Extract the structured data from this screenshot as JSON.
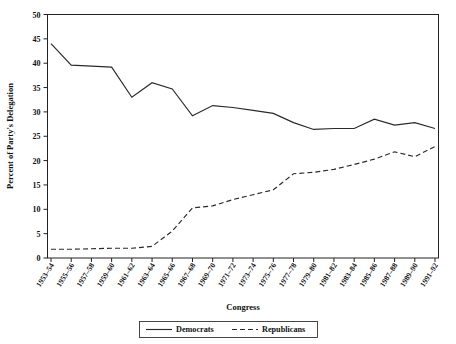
{
  "chart_data": {
    "type": "line",
    "title": "",
    "xlabel": "Congress",
    "ylabel": "Percent of Party's Delegation",
    "ylim": [
      0,
      50
    ],
    "yticks": [
      0,
      5,
      10,
      15,
      20,
      25,
      30,
      35,
      40,
      45,
      50
    ],
    "grid": false,
    "legend_position": "bottom-center",
    "categories": [
      "1953–54",
      "1955–56",
      "1957–58",
      "1959–60",
      "1961–62",
      "1963–64",
      "1965–66",
      "1967–68",
      "1969–70",
      "1971–72",
      "1973–74",
      "1975–76",
      "1977–78",
      "1979–80",
      "1981–82",
      "1983–84",
      "1985–86",
      "1987–88",
      "1989–90",
      "1991–92"
    ],
    "series": [
      {
        "name": "Democrats",
        "style": "solid",
        "color": "#2a2a2a",
        "values": [
          44.0,
          39.6,
          39.4,
          39.2,
          33.0,
          36.0,
          34.7,
          29.2,
          31.3,
          30.9,
          30.3,
          29.7,
          27.8,
          26.4,
          26.6,
          26.6,
          28.5,
          27.3,
          27.8,
          26.6
        ]
      },
      {
        "name": "Republicans",
        "style": "dashed",
        "color": "#2a2a2a",
        "values": [
          1.8,
          1.8,
          1.9,
          2.0,
          2.0,
          2.4,
          5.5,
          10.3,
          10.7,
          12.0,
          13.0,
          14.0,
          17.3,
          17.6,
          18.2,
          19.2,
          20.3,
          21.8,
          20.8,
          22.9
        ]
      }
    ],
    "legend": [
      "Democrats",
      "Republicans"
    ]
  },
  "axis": {
    "y_tick_labels": [
      "0",
      "5",
      "10",
      "15",
      "20",
      "25",
      "30",
      "35",
      "40",
      "45",
      "50"
    ],
    "x_title": "Congress",
    "y_title": "Percent of Party's Delegation"
  },
  "legend": {
    "democrats_label": "Democrats",
    "republicans_label": "Republicans"
  }
}
